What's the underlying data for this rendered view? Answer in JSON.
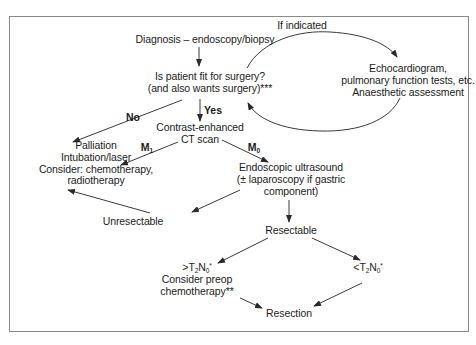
{
  "diagram": {
    "type": "flowchart",
    "topic": "Oesophageal cancer diagnosis and management pathway",
    "nodes": {
      "diagnosis": {
        "text": "Diagnosis – endoscopy/biopsy"
      },
      "fitness": {
        "lines": [
          "Is patient fit for surgery?",
          "(and also wants surgery)***"
        ]
      },
      "workup": {
        "lines": [
          "Echocardiogram,",
          "pulmonary function tests, etc.",
          "Anaesthetic assessment"
        ]
      },
      "palliation": {
        "lines": [
          "Palliation",
          "Intubation/laser",
          "Consider: chemotherapy,",
          "radiotherapy"
        ]
      },
      "ct_scan": {
        "lines": [
          "Contrast-enhanced",
          "CT scan"
        ]
      },
      "eus": {
        "lines": [
          "Endoscopic ultrasound",
          "(± laparoscopy if gastric",
          "component)"
        ]
      },
      "unresectable": {
        "text": "Unresectable"
      },
      "resectable": {
        "text": "Resectable"
      },
      "gt_t2n0": {
        "stage": {
          "prefix": ">T",
          "t_sub": "2",
          "n": "N",
          "n_sub": "0",
          "mark": "*"
        },
        "lines": [
          "Consider preop",
          "chemotherapy**"
        ]
      },
      "lt_t2n0": {
        "stage": {
          "prefix": "<T",
          "t_sub": "2",
          "n": "N",
          "n_sub": "0",
          "mark": "*"
        }
      },
      "resection": {
        "text": "Resection"
      }
    },
    "edge_labels": {
      "if_indicated": "If indicated",
      "no": "No",
      "yes": "Yes",
      "m1": {
        "base": "M",
        "sub": "1"
      },
      "m0": {
        "base": "M",
        "sub": "0"
      }
    },
    "edges": [
      {
        "from": "diagnosis",
        "to": "fitness"
      },
      {
        "from": "fitness",
        "to": "workup",
        "label": "If indicated",
        "style": "curved"
      },
      {
        "from": "workup",
        "to": "fitness",
        "style": "curved"
      },
      {
        "from": "fitness",
        "to": "palliation",
        "label": "No"
      },
      {
        "from": "fitness",
        "to": "ct_scan",
        "label": "Yes"
      },
      {
        "from": "ct_scan",
        "to": "palliation",
        "label": "M1"
      },
      {
        "from": "ct_scan",
        "to": "eus",
        "label": "M0"
      },
      {
        "from": "eus",
        "to": "unresectable"
      },
      {
        "from": "unresectable",
        "to": "palliation"
      },
      {
        "from": "eus",
        "to": "resectable"
      },
      {
        "from": "resectable",
        "to": "gt_t2n0"
      },
      {
        "from": "resectable",
        "to": "lt_t2n0"
      },
      {
        "from": "gt_t2n0",
        "to": "resection"
      },
      {
        "from": "lt_t2n0",
        "to": "resection"
      }
    ],
    "colors": {
      "line": "#3a3a3a",
      "text": "#1c1c1c",
      "frame": "#8a8a8a"
    }
  }
}
